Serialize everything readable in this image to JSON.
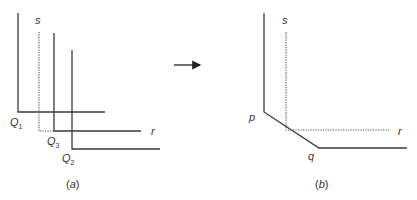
{
  "panel_a": {
    "label_s": "s",
    "label_r": "r",
    "q1": {
      "main": "Q",
      "sub": "1"
    },
    "q3": {
      "main": "Q",
      "sub": "3"
    },
    "q2": {
      "main": "Q",
      "sub": "2"
    },
    "caption_open": "(",
    "caption_letter": "a",
    "caption_close": ")"
  },
  "panel_b": {
    "label_s": "s",
    "label_r": "r",
    "label_p": "p",
    "label_q": "q",
    "caption_open": "(",
    "caption_letter": "b",
    "caption_close": ")"
  },
  "colors": {
    "line": "#3a3a3a",
    "dotted": "#555555",
    "text": "#333333",
    "background": "#ffffff"
  }
}
